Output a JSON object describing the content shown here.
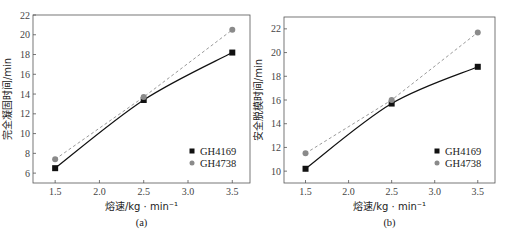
{
  "chart_data": [
    {
      "type": "line",
      "caption": "(a)",
      "title": "",
      "xlabel": "熔速/kg · min⁻¹",
      "ylabel": "完全凝固时间/min",
      "x": [
        1.5,
        2.5,
        3.5
      ],
      "xticks": [
        "1.5",
        "2.0",
        "2.5",
        "3.0",
        "3.5"
      ],
      "yticks": [
        "6",
        "8",
        "10",
        "12",
        "14",
        "16",
        "18",
        "20",
        "22"
      ],
      "xlim": [
        1.25,
        3.7
      ],
      "ylim": [
        5,
        22
      ],
      "grid": false,
      "legend_position": "lower right",
      "series": [
        {
          "name": "GH4169",
          "marker": "square",
          "line": "solid",
          "color": "#111111",
          "values": [
            6.5,
            13.4,
            18.2
          ]
        },
        {
          "name": "GH4738",
          "marker": "circle",
          "line": "dashed",
          "color": "#8a8a8a",
          "values": [
            7.4,
            13.7,
            20.5
          ]
        }
      ]
    },
    {
      "type": "line",
      "caption": "(b)",
      "title": "",
      "xlabel": "熔速/kg · min⁻¹",
      "ylabel": "安全脱模时间/min",
      "x": [
        1.5,
        2.5,
        3.5
      ],
      "xticks": [
        "1.5",
        "2.0",
        "2.5",
        "3.0",
        "3.5"
      ],
      "yticks": [
        "10",
        "12",
        "14",
        "16",
        "18",
        "20",
        "22"
      ],
      "xlim": [
        1.25,
        3.7
      ],
      "ylim": [
        9,
        23
      ],
      "grid": false,
      "legend_position": "lower right",
      "series": [
        {
          "name": "GH4169",
          "marker": "square",
          "line": "solid",
          "color": "#111111",
          "values": [
            10.2,
            15.7,
            18.8
          ]
        },
        {
          "name": "GH4738",
          "marker": "circle",
          "line": "dashed",
          "color": "#8a8a8a",
          "values": [
            11.5,
            16.0,
            21.7
          ]
        }
      ]
    }
  ]
}
